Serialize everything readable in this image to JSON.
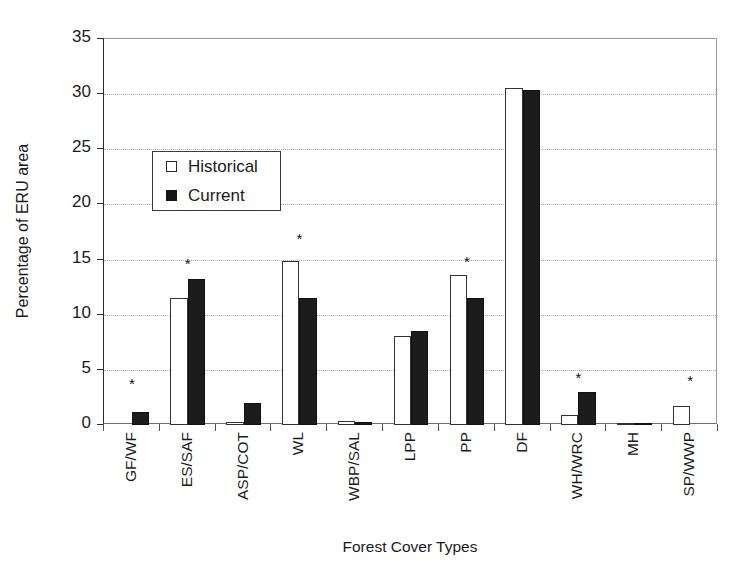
{
  "chart_data": {
    "type": "bar",
    "title": "",
    "xlabel": "Forest Cover Types",
    "ylabel": "Percentage of ERU area",
    "ylim": [
      0,
      35
    ],
    "ytick_step": 5,
    "yticks": [
      "0",
      "5",
      "10",
      "15",
      "20",
      "25",
      "30",
      "35"
    ],
    "grid": "horizontal-dotted",
    "legend_position": "upper-left-inside",
    "categories": [
      "GF/WF",
      "ES/SAF",
      "ASP/COT",
      "WL",
      "WBP/SAL",
      "LPP",
      "PP",
      "DF",
      "WH/WRC",
      "MH",
      "SP/WWP"
    ],
    "series": [
      {
        "name": "Historical",
        "fill": "white",
        "values": [
          0,
          11.5,
          0.3,
          14.9,
          0.35,
          8.1,
          13.6,
          30.6,
          0.9,
          0.1,
          1.7
        ]
      },
      {
        "name": "Current",
        "fill": "black",
        "values": [
          1.2,
          13.2,
          2.0,
          11.5,
          0.25,
          8.5,
          11.5,
          30.4,
          3.0,
          0.05,
          0
        ]
      }
    ],
    "annotations": {
      "symbol": "*",
      "meaning": "significant difference",
      "categories_marked": [
        "GF/WF",
        "ES/SAF",
        "WL",
        "PP",
        "WH/WRC",
        "SP/WWP"
      ],
      "marker_y": [
        3.7,
        14.6,
        16.9,
        14.8,
        4.3,
        4.0
      ]
    },
    "colors": {
      "historical": "#ffffff",
      "current": "#1c1c1c",
      "axis": "#2b2b2b",
      "grid": "#a8a8a8",
      "text": "#1a1a1a"
    }
  },
  "legend": {
    "items": [
      {
        "label": "Historical",
        "swatch": "open-square-swatch"
      },
      {
        "label": "Current",
        "swatch": "filled-square-swatch"
      }
    ]
  },
  "axes": {
    "y_title": "Percentage of ERU area",
    "x_title": "Forest Cover Types"
  }
}
